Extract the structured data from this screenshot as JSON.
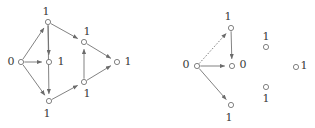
{
  "figure": {
    "type": "diagram",
    "width": 315,
    "height": 128,
    "background_color": "#ffffff",
    "node_stroke_color": "#6b6b6b",
    "node_fill_color": "#ffffff",
    "edge_color": "#6b6b6b",
    "label_color": "#3a3a3a",
    "node_radius": 2.6
  },
  "graphs": [
    {
      "id": "left-graph",
      "name": "left-directed-graph",
      "nodes": [
        {
          "id": "L-top",
          "label": "1",
          "x": 48,
          "y": 22,
          "lx": 46,
          "ly": 11,
          "label_pos": "above"
        },
        {
          "id": "L-left",
          "label": "0",
          "x": 21,
          "y": 62,
          "lx": 11,
          "ly": 61,
          "label_pos": "left"
        },
        {
          "id": "L-center",
          "label": "1",
          "x": 49,
          "y": 62,
          "lx": 61,
          "ly": 61,
          "label_pos": "right"
        },
        {
          "id": "L-bottom",
          "label": "1",
          "x": 49,
          "y": 101,
          "lx": 47,
          "ly": 113,
          "label_pos": "below"
        },
        {
          "id": "L-upper-right",
          "label": "1",
          "x": 84,
          "y": 42,
          "lx": 87,
          "ly": 31,
          "label_pos": "above"
        },
        {
          "id": "L-lower-right",
          "label": "1",
          "x": 84,
          "y": 82,
          "lx": 87,
          "ly": 93,
          "label_pos": "below"
        },
        {
          "id": "L-right",
          "label": "1",
          "x": 117,
          "y": 62,
          "lx": 128,
          "ly": 61,
          "label_pos": "right"
        }
      ],
      "edges": [
        {
          "from": "L-left",
          "to": "L-top",
          "style": "solid",
          "arrow": true
        },
        {
          "from": "L-left",
          "to": "L-center",
          "style": "solid",
          "arrow": true
        },
        {
          "from": "L-left",
          "to": "L-bottom",
          "style": "solid",
          "arrow": true
        },
        {
          "from": "L-top",
          "to": "L-center",
          "style": "solid",
          "arrow": true
        },
        {
          "from": "L-top",
          "to": "L-bottom",
          "style": "solid",
          "arrow": true
        },
        {
          "from": "L-top",
          "to": "L-upper-right",
          "style": "solid",
          "arrow": true
        },
        {
          "from": "L-upper-right",
          "to": "L-right",
          "style": "solid",
          "arrow": true
        },
        {
          "from": "L-lower-right",
          "to": "L-upper-right",
          "style": "solid",
          "arrow": true
        },
        {
          "from": "L-bottom",
          "to": "L-lower-right",
          "style": "solid",
          "arrow": true
        },
        {
          "from": "L-lower-right",
          "to": "L-right",
          "style": "solid",
          "arrow": true
        }
      ]
    },
    {
      "id": "right-graph",
      "name": "right-directed-graph",
      "nodes": [
        {
          "id": "R-top",
          "label": "1",
          "x": 231,
          "y": 28,
          "lx": 228,
          "ly": 16,
          "label_pos": "above"
        },
        {
          "id": "R-left",
          "label": "0",
          "x": 197,
          "y": 66,
          "lx": 186,
          "ly": 64,
          "label_pos": "left"
        },
        {
          "id": "R-center",
          "label": "0",
          "x": 232,
          "y": 66,
          "lx": 243,
          "ly": 64,
          "label_pos": "right"
        },
        {
          "id": "R-bottom",
          "label": "1",
          "x": 231,
          "y": 105,
          "lx": 229,
          "ly": 117,
          "label_pos": "below"
        },
        {
          "id": "R-iso-upper",
          "label": "1",
          "x": 266,
          "y": 47,
          "lx": 266,
          "ly": 36,
          "label_pos": "above"
        },
        {
          "id": "R-iso-right",
          "label": "1",
          "x": 296,
          "y": 67,
          "lx": 304,
          "ly": 65,
          "label_pos": "right"
        },
        {
          "id": "R-iso-lower",
          "label": "1",
          "x": 266,
          "y": 87,
          "lx": 266,
          "ly": 98,
          "label_pos": "below"
        }
      ],
      "edges": [
        {
          "from": "R-left",
          "to": "R-top",
          "style": "dashed",
          "arrow": true
        },
        {
          "from": "R-left",
          "to": "R-center",
          "style": "solid",
          "arrow": true
        },
        {
          "from": "R-top",
          "to": "R-center",
          "style": "solid",
          "arrow": true
        },
        {
          "from": "R-left",
          "to": "R-bottom",
          "style": "solid",
          "arrow": true
        }
      ]
    }
  ]
}
